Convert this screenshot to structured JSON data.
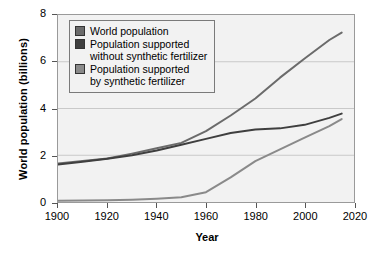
{
  "chart_data": {
    "type": "line",
    "title": "",
    "xlabel": "Year",
    "ylabel": "World population (billions)",
    "xlim": [
      1900,
      2020
    ],
    "ylim": [
      0,
      8
    ],
    "xticks": [
      "1900",
      "1920",
      "1940",
      "1960",
      "1980",
      "2000",
      "2020"
    ],
    "yticks": [
      "0",
      "2",
      "4",
      "6",
      "8"
    ],
    "grid": true,
    "grid_axis": "y",
    "legend_position": "upper-left-inside",
    "series": [
      {
        "name": "World population",
        "color": "#6b6b6b",
        "x": [
          1900,
          1910,
          1920,
          1930,
          1940,
          1950,
          1960,
          1970,
          1980,
          1990,
          2000,
          2010,
          2015
        ],
        "values": [
          1.65,
          1.75,
          1.86,
          2.07,
          2.3,
          2.53,
          3.03,
          3.7,
          4.43,
          5.32,
          6.14,
          6.93,
          7.25
        ]
      },
      {
        "name": "Population supported\nwithout synthetic fertilizer",
        "color": "#3f3f3f",
        "x": [
          1900,
          1910,
          1920,
          1930,
          1940,
          1950,
          1960,
          1970,
          1980,
          1990,
          2000,
          2010,
          2015
        ],
        "values": [
          1.6,
          1.72,
          1.85,
          2.0,
          2.2,
          2.45,
          2.7,
          2.95,
          3.1,
          3.15,
          3.3,
          3.6,
          3.78
        ]
      },
      {
        "name": "Population supported\nby synthetic fertilizer",
        "color": "#8a8a8a",
        "x": [
          1900,
          1910,
          1920,
          1930,
          1940,
          1950,
          1960,
          1970,
          1980,
          1990,
          2000,
          2010,
          2015
        ],
        "values": [
          0.05,
          0.06,
          0.08,
          0.1,
          0.14,
          0.2,
          0.42,
          1.05,
          1.75,
          2.25,
          2.75,
          3.25,
          3.55
        ]
      }
    ]
  },
  "legend": {
    "items": [
      {
        "label": "World population",
        "swatch": "#6b6b6b"
      },
      {
        "label": "Population supported\nwithout synthetic fertilizer",
        "swatch": "#3f3f3f"
      },
      {
        "label": "Population supported\nby synthetic fertilizer",
        "swatch": "#8a8a8a"
      }
    ]
  },
  "axes": {
    "x_title": "Year",
    "y_title": "World population (billions)",
    "x_ticks": [
      "1900",
      "1920",
      "1940",
      "1960",
      "1980",
      "2000",
      "2020"
    ],
    "y_ticks": [
      "0",
      "2",
      "4",
      "6",
      "8"
    ]
  }
}
